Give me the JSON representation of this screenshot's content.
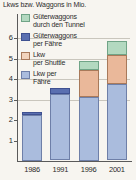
{
  "chart_data": {
    "type": "bar",
    "stacked": true,
    "title": "Lkws bzw. Waggons in Mio.",
    "xlabel": "",
    "ylabel": "",
    "categories": [
      "1986",
      "1991",
      "1996",
      "2001"
    ],
    "ylim": [
      0,
      6.4
    ],
    "yticks": [
      1,
      2,
      3,
      4,
      5,
      6
    ],
    "ytick_labels": [
      "1",
      "2",
      "3",
      "4",
      "5",
      "6"
    ],
    "grid": true,
    "legend_position": "upper-left-inside",
    "series": [
      {
        "name": "Lkw per Fähre",
        "name_line1": "Lkw per",
        "name_line2": "Fähre",
        "color": "#aabcdd",
        "values": [
          2.2,
          3.25,
          3.1,
          3.75
        ]
      },
      {
        "name": "Lkw per Shuttle",
        "name_line1": "Lkw",
        "name_line2": "per Shuttle",
        "color": "#eab89a",
        "values": [
          0,
          0,
          1.3,
          1.4
        ]
      },
      {
        "name": "Güterwaggons per Fähre",
        "name_line1": "Güterwaggons",
        "name_line2": "per Fähre",
        "color": "#5a6fb0",
        "values": [
          0.15,
          0.3,
          0,
          0
        ]
      },
      {
        "name": "Güterwaggons durch den Tunnel",
        "name_line1": "Güterwaggons",
        "name_line2": "durch den Tunnel",
        "color": "#b3d9c0",
        "values": [
          0,
          0,
          0.45,
          0.7
        ]
      }
    ],
    "totals": [
      2.35,
      3.55,
      4.85,
      5.85
    ]
  },
  "legend": {
    "items": [
      {
        "label_line1": "Güterwaggons",
        "label_line2": "durch den Tunnel",
        "color": "#b3d9c0"
      },
      {
        "label_line1": "Güterwaggons",
        "label_line2": "per Fähre",
        "color": "#5a6fb0"
      },
      {
        "label_line1": "Lkw",
        "label_line2": "per Shuttle",
        "color": "#eab89a"
      },
      {
        "label_line1": "Lkw per",
        "label_line2": "Fähre",
        "color": "#aabcdd"
      }
    ]
  }
}
